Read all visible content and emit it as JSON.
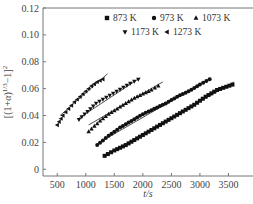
{
  "chart_data": {
    "type": "scatter",
    "title": "",
    "xlabel": "t/s",
    "ylabel": "[(1+α)^{1/3}−1]^2",
    "xlim": [
      250,
      3930
    ],
    "ylim": [
      -0.005,
      0.12
    ],
    "xticks": [
      500,
      1000,
      1500,
      2000,
      2500,
      3000,
      3500
    ],
    "yticks": [
      0,
      0.02,
      0.04,
      0.06,
      0.08,
      0.1,
      0.12
    ],
    "ytick_labels": [
      "0",
      "0.02",
      "0.04",
      "0.06",
      "0.08",
      "0.10",
      "0.12"
    ],
    "grid": false,
    "legend_position": "upper inside",
    "series": [
      {
        "name": "873 K",
        "marker": "square",
        "x": [
          1330,
          1500,
          1700,
          1900,
          2100,
          2300,
          2500,
          2700,
          2900,
          3100,
          3300,
          3570
        ],
        "y": [
          0.01,
          0.014,
          0.018,
          0.023,
          0.028,
          0.033,
          0.038,
          0.043,
          0.048,
          0.054,
          0.059,
          0.063
        ],
        "fit": [
          [
            1330,
            0.01
          ],
          [
            3600,
            0.065
          ]
        ]
      },
      {
        "name": "973 K",
        "marker": "circle",
        "x": [
          1200,
          1400,
          1600,
          1800,
          2000,
          2200,
          2400,
          2600,
          2800,
          3000,
          3170
        ],
        "y": [
          0.018,
          0.025,
          0.031,
          0.036,
          0.041,
          0.045,
          0.049,
          0.054,
          0.058,
          0.063,
          0.067
        ],
        "fit": [
          [
            1200,
            0.019
          ],
          [
            3200,
            0.068
          ]
        ]
      },
      {
        "name": "1073 K",
        "marker": "triangle-up",
        "x": [
          1050,
          1150,
          1250,
          1400,
          1550,
          1700,
          1850,
          2000,
          2150,
          2270
        ],
        "y": [
          0.028,
          0.032,
          0.036,
          0.041,
          0.045,
          0.049,
          0.053,
          0.056,
          0.059,
          0.062
        ],
        "fit": [
          [
            1050,
            0.033
          ],
          [
            2350,
            0.065
          ]
        ]
      },
      {
        "name": "1173 K",
        "marker": "triangle-down",
        "x": [
          880,
          980,
          1080,
          1180,
          1300,
          1420,
          1540,
          1660,
          1780,
          1920
        ],
        "y": [
          0.037,
          0.041,
          0.045,
          0.049,
          0.052,
          0.055,
          0.058,
          0.061,
          0.064,
          0.067
        ],
        "fit": [
          [
            880,
            0.038
          ],
          [
            1950,
            0.068
          ]
        ]
      },
      {
        "name": "1273 K",
        "marker": "triangle-left",
        "x": [
          500,
          600,
          700,
          800,
          900,
          1000,
          1100,
          1200,
          1300
        ],
        "y": [
          0.033,
          0.04,
          0.045,
          0.05,
          0.054,
          0.058,
          0.062,
          0.065,
          0.067
        ],
        "fit": [
          [
            550,
            0.04
          ],
          [
            1380,
            0.071
          ]
        ]
      }
    ]
  },
  "legend": {
    "items": [
      {
        "label": "873 K",
        "marker": "square"
      },
      {
        "label": "973 K",
        "marker": "circle"
      },
      {
        "label": "1073 K",
        "marker": "triangle-up"
      },
      {
        "label": "1173 K",
        "marker": "triangle-down"
      },
      {
        "label": "1273 K",
        "marker": "triangle-left"
      }
    ]
  },
  "axes": {
    "xlabel": "t/s",
    "ylabel": "[(1+α)^{1/3}−1]^2"
  }
}
